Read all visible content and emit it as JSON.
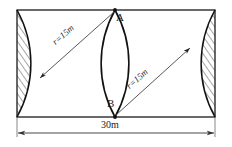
{
  "figure": {
    "labels": {
      "point_top": "A",
      "point_bottom": "B",
      "width_dimension": "30m",
      "radius_left": "r=15m",
      "radius_right": "r=15m"
    },
    "geometry": {
      "rect_width_m": 30,
      "radius_m": 15,
      "rect_left_px": 17,
      "rect_right_px": 215,
      "rect_top_px": 10,
      "rect_bottom_px": 117,
      "point_A_px": [
        115,
        10
      ],
      "point_B_px": [
        115,
        117
      ],
      "arc_left_center_px": [
        215,
        63.5
      ],
      "arc_right_center_px": [
        17,
        63.5
      ],
      "arc_radius_px": 110
    },
    "colors": {
      "stroke": "#1a1a1a",
      "arc_stroke": "#111111",
      "hatch": "#3a3a3a",
      "background": "#ffffff",
      "dimension": "#444444"
    }
  }
}
